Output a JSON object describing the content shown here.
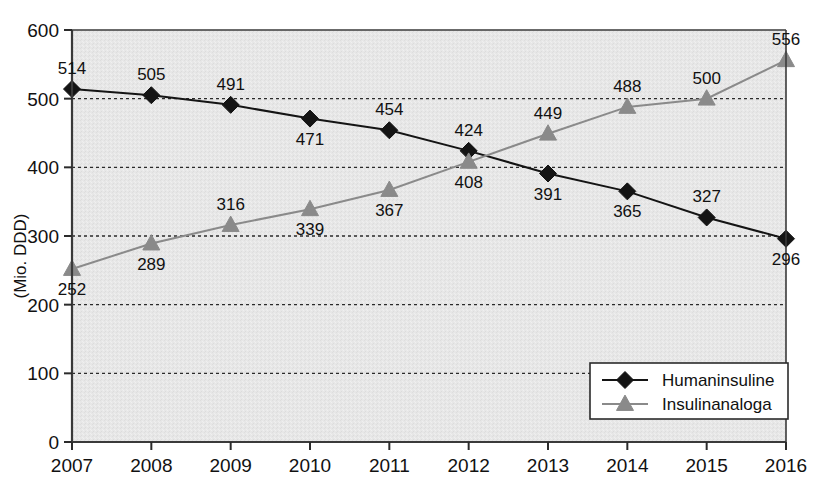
{
  "chart_data": {
    "type": "line",
    "title": "",
    "xlabel": "",
    "ylabel": "(Mio. DDD)",
    "categories": [
      "2007",
      "2008",
      "2009",
      "2010",
      "2011",
      "2012",
      "2013",
      "2014",
      "2015",
      "2016"
    ],
    "x": [
      2007,
      2008,
      2009,
      2010,
      2011,
      2012,
      2013,
      2014,
      2015,
      2016
    ],
    "xlim": [
      2007,
      2016
    ],
    "ylim": [
      0,
      600
    ],
    "yticks": [
      0,
      100,
      200,
      300,
      400,
      500,
      600
    ],
    "ytick_labels": [
      "0",
      "100",
      "200",
      "300",
      "400",
      "500",
      "600"
    ],
    "grid": true,
    "grid_style": "dashed-horizontal",
    "legend_position": "bottom-right",
    "plot_background": "#e6e6e6",
    "series": [
      {
        "name": "Humaninsuline",
        "color": "#141414",
        "marker": "diamond",
        "values": [
          514,
          505,
          491,
          471,
          454,
          424,
          391,
          365,
          327,
          296
        ],
        "label_positions": [
          "above",
          "above",
          "above",
          "below",
          "above",
          "above",
          "below",
          "below",
          "above",
          "below"
        ]
      },
      {
        "name": "Insulinanaloga",
        "color": "#8a8a8a",
        "marker": "triangle",
        "values": [
          252,
          289,
          316,
          339,
          367,
          408,
          449,
          488,
          500,
          556
        ],
        "label_positions": [
          "below",
          "below",
          "above",
          "below",
          "below",
          "below",
          "above",
          "above",
          "above",
          "above"
        ]
      }
    ]
  },
  "legend": {
    "items": [
      {
        "label": "Humaninsuline",
        "marker": "diamond",
        "color": "#141414"
      },
      {
        "label": "Insulinanaloga",
        "marker": "triangle",
        "color": "#8a8a8a"
      }
    ]
  },
  "axis": {
    "y_title": "(Mio. DDD)"
  }
}
